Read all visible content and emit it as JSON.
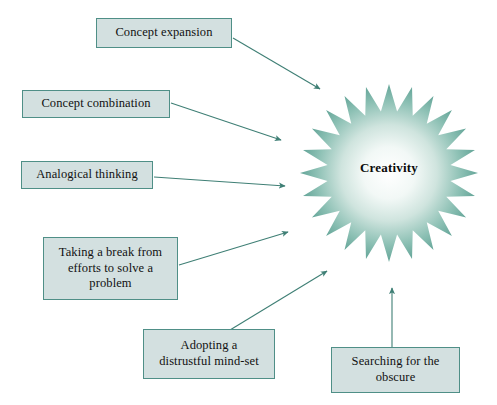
{
  "figure": {
    "background_color": "#ffffff",
    "box_fill_color": "#d3e0e0",
    "box_border_color": "#4f8f87",
    "arrow_color": "#3f7f75",
    "star_edge_color": "#5fa396",
    "star_center_color": "#ffffff",
    "text_color": "#111111"
  },
  "center": {
    "label": "Creativity",
    "shape": "star-burst",
    "points": 24
  },
  "nodes": [
    {
      "id": "concept-expansion",
      "label": "Concept expansion",
      "x": 96,
      "y": 18,
      "w": 136,
      "h": 30
    },
    {
      "id": "concept-combination",
      "label": "Concept combination",
      "x": 22,
      "y": 90,
      "w": 148,
      "h": 28
    },
    {
      "id": "analogical-thinking",
      "label": "Analogical thinking",
      "x": 21,
      "y": 161,
      "w": 132,
      "h": 28
    },
    {
      "id": "taking-a-break",
      "label": "Taking a break from\nefforts to solve a\nproblem",
      "x": 43,
      "y": 237,
      "w": 135,
      "h": 63
    },
    {
      "id": "distrustful-mind-set",
      "label": "Adopting a\ndistrustful mind-set",
      "x": 143,
      "y": 329,
      "w": 132,
      "h": 50
    },
    {
      "id": "searching-obscure",
      "label": "Searching for the\nobscure",
      "x": 331,
      "y": 347,
      "w": 129,
      "h": 46
    }
  ],
  "arrows": [
    {
      "id": "arrow-concept-expansion",
      "from": "concept-expansion",
      "to": "creativity-star",
      "x1": 233,
      "y1": 38,
      "x2": 320,
      "y2": 89
    },
    {
      "id": "arrow-concept-combination",
      "from": "concept-combination",
      "to": "creativity-star",
      "x1": 171,
      "y1": 103,
      "x2": 281,
      "y2": 140
    },
    {
      "id": "arrow-analogical-thinking",
      "from": "analogical-thinking",
      "to": "creativity-star",
      "x1": 154,
      "y1": 177,
      "x2": 285,
      "y2": 186
    },
    {
      "id": "arrow-taking-a-break",
      "from": "taking-a-break",
      "to": "creativity-star",
      "x1": 179,
      "y1": 265,
      "x2": 288,
      "y2": 232
    },
    {
      "id": "arrow-distrustful-mind-set",
      "from": "distrustful-mind-set",
      "to": "creativity-star",
      "x1": 230,
      "y1": 330,
      "x2": 327,
      "y2": 271
    },
    {
      "id": "arrow-searching-obscure",
      "from": "searching-obscure",
      "to": "creativity-star",
      "x1": 392,
      "y1": 347,
      "x2": 392,
      "y2": 288
    }
  ]
}
